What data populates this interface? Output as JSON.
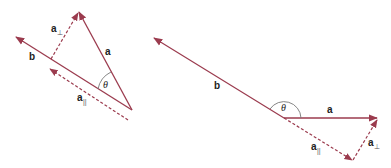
{
  "colors": {
    "vector": "#9b3b4e",
    "arc": "#777777",
    "text": "#222222"
  },
  "left_diagram": {
    "labels": {
      "b": "b",
      "a": "a",
      "a_perp": "a",
      "a_perp_sub": "⊥",
      "a_par": "a",
      "a_par_sub": "||",
      "theta": "θ"
    }
  },
  "right_diagram": {
    "labels": {
      "b": "b",
      "a": "a",
      "a_perp": "a",
      "a_perp_sub": "⊥",
      "a_par": "a",
      "a_par_sub": "||",
      "theta": "θ"
    }
  }
}
